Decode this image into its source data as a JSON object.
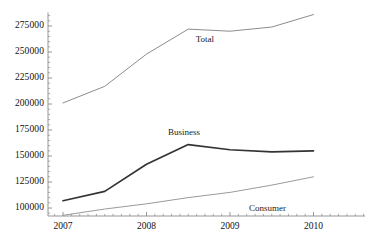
{
  "chart_data": {
    "type": "line",
    "title": "",
    "xlabel": "",
    "ylabel": "",
    "x": [
      2007,
      2007.5,
      2008,
      2008.5,
      2009,
      2009.5,
      2010
    ],
    "xlim": [
      2006.75,
      2010.65
    ],
    "ylim": [
      90000,
      288000
    ],
    "grid": false,
    "legend_position": "inline-annotations",
    "xticks": [
      {
        "value": 2007,
        "label": "2007"
      },
      {
        "value": 2008,
        "label": "2008"
      },
      {
        "value": 2009,
        "label": "2009"
      },
      {
        "value": 2010,
        "label": "2010"
      }
    ],
    "yticks": [
      {
        "value": 100000,
        "label": "100000"
      },
      {
        "value": 125000,
        "label": "125000"
      },
      {
        "value": 150000,
        "label": "150000"
      },
      {
        "value": 175000,
        "label": "175000"
      },
      {
        "value": 200000,
        "label": "200000"
      },
      {
        "value": 225000,
        "label": "225000"
      },
      {
        "value": 250000,
        "label": "250000"
      },
      {
        "value": 275000,
        "label": "275000"
      }
    ],
    "series": [
      {
        "name": "Total",
        "color": "#8c8c8c",
        "width": 1.0,
        "values": [
          201000,
          217000,
          248000,
          272000,
          270000,
          274000,
          286000
        ],
        "annotation": {
          "text": "Total",
          "x": 2008.7,
          "y": 262000
        }
      },
      {
        "name": "Business",
        "color": "#333333",
        "width": 1.7,
        "values": [
          107000,
          116000,
          142000,
          161000,
          156000,
          154000,
          155000
        ],
        "annotation": {
          "text": "Business",
          "x": 2008.45,
          "y": 172000
        }
      },
      {
        "name": "Consumer",
        "color": "#9a9a9a",
        "width": 1.0,
        "values": [
          93000,
          99000,
          104000,
          110000,
          115000,
          122000,
          130000
        ],
        "annotation": {
          "text": "Consumer",
          "x": 2009.45,
          "y": 99000
        }
      }
    ],
    "axis_color": "#8a8a8a",
    "minor_ticks": true
  }
}
